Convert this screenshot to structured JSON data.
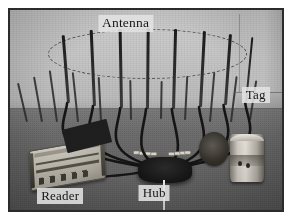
{
  "figure": {
    "type": "photograph",
    "palette": {
      "frame_border": "#2b2b2b",
      "page_background": "#ffffff",
      "wall_background": "#c8c8c8",
      "table_surface": "#6a6a6a",
      "antenna_black": "#1a1a1a",
      "cable_black": "#141414",
      "reader_case": "#c4c0b4",
      "tag_body": "#e6e2d9",
      "label_background": "#e2e2e2",
      "label_text": "#151515"
    }
  },
  "labels": {
    "antenna": "Antenna",
    "reader": "Reader",
    "hub": "Hub",
    "tag": "Tag"
  },
  "scene": {
    "antenna_array": {
      "name": "circular antenna array",
      "element_count": 8,
      "arrangement": "ring marked by dashed ellipse",
      "elements": [
        {
          "id": 1,
          "x_pct": 21.0,
          "top_pct": 12.5,
          "height_pct": 34.0,
          "tilt_deg": -4.5,
          "width_px": 2.6
        },
        {
          "id": 2,
          "x_pct": 30.5,
          "top_pct": 10.0,
          "height_pct": 38.0,
          "tilt_deg": -2.5,
          "width_px": 2.8
        },
        {
          "id": 3,
          "x_pct": 40.5,
          "top_pct": 9.5,
          "height_pct": 39.5,
          "tilt_deg": -1.0,
          "width_px": 2.8
        },
        {
          "id": 4,
          "x_pct": 50.0,
          "top_pct": 9.0,
          "height_pct": 40.5,
          "tilt_deg": 0.5,
          "width_px": 2.8
        },
        {
          "id": 5,
          "x_pct": 59.5,
          "top_pct": 9.5,
          "height_pct": 40.0,
          "tilt_deg": 1.5,
          "width_px": 2.8
        },
        {
          "id": 6,
          "x_pct": 69.5,
          "top_pct": 10.5,
          "height_pct": 38.0,
          "tilt_deg": 3.0,
          "width_px": 2.8
        },
        {
          "id": 7,
          "x_pct": 78.5,
          "top_pct": 12.0,
          "height_pct": 35.5,
          "tilt_deg": 4.0,
          "width_px": 2.6
        },
        {
          "id": 8,
          "x_pct": 86.5,
          "top_pct": 13.5,
          "height_pct": 33.0,
          "tilt_deg": 5.5,
          "width_px": 2.4
        }
      ]
    },
    "background_rods": [
      {
        "x_pct": 6.0,
        "top_pct": 36.0,
        "height_pct": 20.0,
        "tilt_deg": -13
      },
      {
        "x_pct": 11.5,
        "top_pct": 33.0,
        "height_pct": 23.0,
        "tilt_deg": -10
      },
      {
        "x_pct": 17.0,
        "top_pct": 30.0,
        "height_pct": 26.0,
        "tilt_deg": -8
      },
      {
        "x_pct": 24.5,
        "top_pct": 31.0,
        "height_pct": 25.0,
        "tilt_deg": -6
      },
      {
        "x_pct": 33.0,
        "top_pct": 33.5,
        "height_pct": 22.0,
        "tilt_deg": -3
      },
      {
        "x_pct": 44.0,
        "top_pct": 35.0,
        "height_pct": 20.0,
        "tilt_deg": -1
      },
      {
        "x_pct": 55.0,
        "top_pct": 35.5,
        "height_pct": 19.0,
        "tilt_deg": 1
      },
      {
        "x_pct": 64.0,
        "top_pct": 33.0,
        "height_pct": 22.0,
        "tilt_deg": 3
      },
      {
        "x_pct": 73.0,
        "top_pct": 31.0,
        "height_pct": 25.0,
        "tilt_deg": 5
      },
      {
        "x_pct": 81.0,
        "top_pct": 33.0,
        "height_pct": 23.0,
        "tilt_deg": 7
      },
      {
        "x_pct": 88.0,
        "top_pct": 35.0,
        "height_pct": 20.0,
        "tilt_deg": 9
      }
    ],
    "cables": {
      "count": 8,
      "description": "black coaxial feed lines curving from each antenna base down to the central hub",
      "color": "#141414"
    },
    "devices": [
      {
        "name": "reader",
        "description": "rectangular light-cased RFID reader unit at lower left"
      },
      {
        "name": "hub",
        "description": "dark cable-junction hub at lower center where all coax lines converge"
      },
      {
        "name": "tag",
        "description": "cylindrical tagged object standing on the table at right"
      }
    ]
  }
}
